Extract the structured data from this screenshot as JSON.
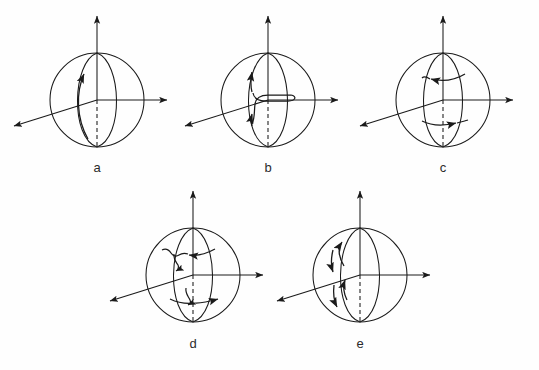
{
  "figure": {
    "background_color": "#fefefe",
    "stroke_color": "#1a1a1a",
    "label_color": "#2b2b2b",
    "panel_count": 5
  },
  "panels": [
    {
      "id": "a",
      "label": "a",
      "description": "sphere with vertical axis, single upward curved arrow along the front meridian",
      "center_x": 97,
      "center_y": 100,
      "radius": 47,
      "label_x": 97,
      "label_y": 172,
      "arrow_count": 1,
      "arrow_kind": "single-meridian-up"
    },
    {
      "id": "b",
      "label": "b",
      "description": "sphere with Z / double-hook shaped curve and two upward arrows",
      "center_x": 268,
      "center_y": 100,
      "radius": 47,
      "label_x": 268,
      "label_y": 172,
      "arrow_count": 2,
      "arrow_kind": "z-hook-double-up"
    },
    {
      "id": "c",
      "label": "c",
      "description": "sphere with two horizontal arcs, upper arrow pointing left, lower arrow pointing right",
      "center_x": 443,
      "center_y": 100,
      "radius": 47,
      "label_x": 443,
      "label_y": 172,
      "arrow_count": 2,
      "arrow_kind": "two-latitude-arcs"
    },
    {
      "id": "d",
      "label": "d",
      "description": "sphere with two horizontal arcs each carrying a small downward hooked squiggle arrow",
      "center_x": 193,
      "center_y": 275,
      "radius": 47,
      "label_x": 193,
      "label_y": 348,
      "arrow_count": 4,
      "arrow_kind": "two-latitude-arcs-with-hooks"
    },
    {
      "id": "e",
      "label": "e",
      "description": "sphere with four alternating up and down arrows along the front meridian",
      "center_x": 360,
      "center_y": 275,
      "radius": 47,
      "label_x": 360,
      "label_y": 348,
      "arrow_count": 4,
      "arrow_kind": "alternating-meridian"
    }
  ],
  "axes": {
    "z_label": "",
    "x_label": "",
    "y_label": "",
    "z_top_extension": 37,
    "x_right_extension": 40,
    "y_diagonal_dx": -75,
    "y_diagonal_dy": 30,
    "dashed_below_axis": true,
    "dash_pattern": "4,3"
  }
}
